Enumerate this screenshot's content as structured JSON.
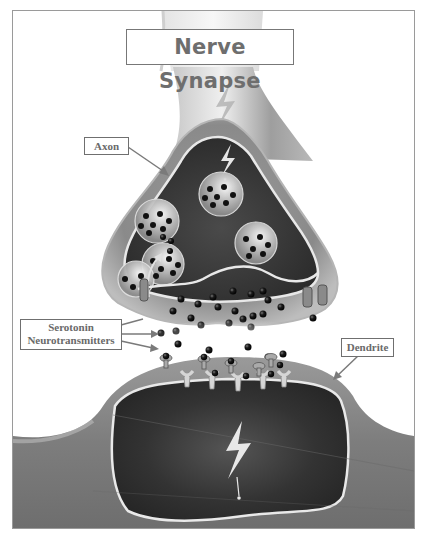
{
  "title": "Nerve Synapse",
  "labels": {
    "axon": "Axon",
    "serotonin_line1": "Serotonin",
    "serotonin_line2": "Neurotransmitters",
    "dendrite": "Dendrite"
  },
  "components": [
    {
      "name": "axon-terminal",
      "description": "Presynaptic neuron terminal with vesicles"
    },
    {
      "name": "synaptic-vesicles",
      "count": 5
    },
    {
      "name": "serotonin-neurotransmitters",
      "description": "Dark spheres released into synaptic cleft"
    },
    {
      "name": "receptors",
      "description": "Receptor sites on postsynaptic membrane"
    },
    {
      "name": "dendrite",
      "description": "Postsynaptic neuron"
    },
    {
      "name": "electrical-impulse",
      "description": "Lightning bolt symbols indicating nerve signal"
    }
  ],
  "colors": {
    "background": "#ffffff",
    "frame": "#9a9a9a",
    "neuron_outer": "#8c8c8c",
    "neuron_inner_dark": "#2b2b2b",
    "membrane": "#e6e6e6",
    "neurotransmitter": "#111111",
    "label_text": "#6a6a6a"
  }
}
